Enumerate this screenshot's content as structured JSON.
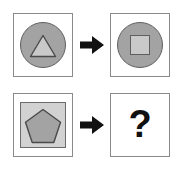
{
  "diagram": {
    "type": "visual-analogy-puzzle",
    "rows": [
      {
        "id": "row-1",
        "left_panel": {
          "name": "circle-with-triangle",
          "outer_shape": "circle",
          "outer_fill": "#a3a3a3",
          "outer_stroke": "#5f5f5f",
          "inner_shape": "triangle",
          "inner_fill": "#c9c9c9",
          "inner_stroke": "#4a4a4a",
          "label": "circle containing triangle"
        },
        "arrow": {
          "name": "transform-arrow",
          "glyph": "right-arrow",
          "color": "#111111",
          "label": "transforms into"
        },
        "right_panel": {
          "name": "circle-with-square",
          "outer_shape": "circle",
          "outer_fill": "#a3a3a3",
          "outer_stroke": "#5f5f5f",
          "inner_shape": "square",
          "inner_fill": "#c9c9c9",
          "inner_stroke": "#5f5f5f",
          "label": "circle containing square"
        }
      },
      {
        "id": "row-2",
        "left_panel": {
          "name": "square-with-pentagon",
          "outer_shape": "square",
          "outer_fill": "#d2d2d2",
          "outer_stroke": "#6b6b6b",
          "inner_shape": "pentagon",
          "inner_fill": "#a3a3a3",
          "inner_stroke": "#4a4a4a",
          "label": "square containing pentagon"
        },
        "arrow": {
          "name": "transform-arrow",
          "glyph": "right-arrow",
          "color": "#111111",
          "label": "transforms into"
        },
        "right_panel": {
          "name": "unknown-answer",
          "outer_shape": "none",
          "content": "?",
          "label": "unknown answer"
        }
      }
    ],
    "colors": {
      "panel_border": "#8a8a8a",
      "background": "#ffffff",
      "medium_gray": "#a3a3a3",
      "light_gray": "#d2d2d2",
      "pale_gray": "#c9c9c9",
      "shape_outline": "#4a4a4a",
      "arrow": "#111111",
      "question_mark": "#111111"
    }
  }
}
